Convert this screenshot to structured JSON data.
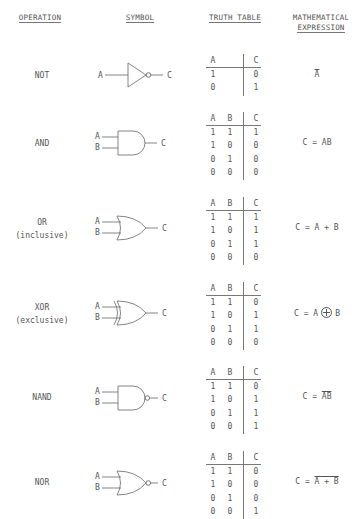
{
  "headers": {
    "operation": "OPERATION",
    "symbol": "SYMBOL",
    "truth_table": "TRUTH TABLE",
    "math_line1": "MATHEMATICAL",
    "math_line2": "EXPRESSION"
  },
  "gates": [
    {
      "name": "NOT",
      "subtitle": "",
      "symbol_icon": "not-gate-icon",
      "inputs": [
        "A"
      ],
      "output": "C",
      "table_headers": [
        "A",
        "C"
      ],
      "rows": [
        [
          "1",
          "0"
        ],
        [
          "0",
          "1"
        ]
      ],
      "expression": {
        "prefix": "",
        "overlined": "A",
        "suffix": ""
      }
    },
    {
      "name": "AND",
      "subtitle": "",
      "symbol_icon": "and-gate-icon",
      "inputs": [
        "A",
        "B"
      ],
      "output": "C",
      "table_headers": [
        "A",
        "B",
        "C"
      ],
      "rows": [
        [
          "1",
          "1",
          "1"
        ],
        [
          "1",
          "0",
          "0"
        ],
        [
          "0",
          "1",
          "0"
        ],
        [
          "0",
          "0",
          "0"
        ]
      ],
      "expression": {
        "text": "C = AB"
      }
    },
    {
      "name": "OR",
      "subtitle": "(inclusive)",
      "symbol_icon": "or-gate-icon",
      "inputs": [
        "A",
        "B"
      ],
      "output": "C",
      "table_headers": [
        "A",
        "B",
        "C"
      ],
      "rows": [
        [
          "1",
          "1",
          "1"
        ],
        [
          "1",
          "0",
          "1"
        ],
        [
          "0",
          "1",
          "1"
        ],
        [
          "0",
          "0",
          "0"
        ]
      ],
      "expression": {
        "text": "C = A + B"
      }
    },
    {
      "name": "XOR",
      "subtitle": "(exclusive)",
      "symbol_icon": "xor-gate-icon",
      "inputs": [
        "A",
        "B"
      ],
      "output": "C",
      "table_headers": [
        "A",
        "B",
        "C"
      ],
      "rows": [
        [
          "1",
          "1",
          "0"
        ],
        [
          "1",
          "0",
          "1"
        ],
        [
          "0",
          "1",
          "1"
        ],
        [
          "0",
          "0",
          "0"
        ]
      ],
      "expression": {
        "left": "C = A",
        "right": "B"
      }
    },
    {
      "name": "NAND",
      "subtitle": "",
      "symbol_icon": "nand-gate-icon",
      "inputs": [
        "A",
        "B"
      ],
      "output": "C",
      "table_headers": [
        "A",
        "B",
        "C"
      ],
      "rows": [
        [
          "1",
          "1",
          "0"
        ],
        [
          "1",
          "0",
          "1"
        ],
        [
          "0",
          "1",
          "1"
        ],
        [
          "0",
          "0",
          "1"
        ]
      ],
      "expression": {
        "prefix": "C = ",
        "overlined": "AB"
      }
    },
    {
      "name": "NOR",
      "subtitle": "",
      "symbol_icon": "nor-gate-icon",
      "inputs": [
        "A",
        "B"
      ],
      "output": "C",
      "table_headers": [
        "A",
        "B",
        "C"
      ],
      "rows": [
        [
          "1",
          "1",
          "0"
        ],
        [
          "1",
          "0",
          "0"
        ],
        [
          "0",
          "1",
          "0"
        ],
        [
          "0",
          "0",
          "1"
        ]
      ],
      "expression": {
        "prefix": "C = ",
        "overlined": "A + B"
      }
    }
  ],
  "colors": {
    "ink": "#555555",
    "background": "#ffffff"
  }
}
